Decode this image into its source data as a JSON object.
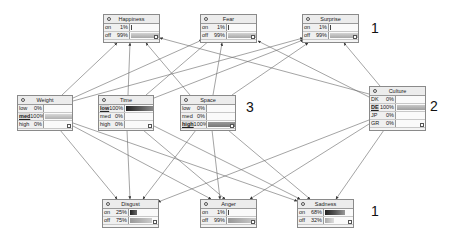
{
  "nodes": {
    "happiness": {
      "title": "Happiness",
      "states": [
        {
          "name": "on",
          "value": "1%",
          "pct": 1
        },
        {
          "name": "off",
          "value": "99%",
          "pct": 99
        }
      ]
    },
    "fear": {
      "title": "Fear",
      "states": [
        {
          "name": "on",
          "value": "1%",
          "pct": 1
        },
        {
          "name": "off",
          "value": "99%",
          "pct": 99
        }
      ]
    },
    "surprise": {
      "title": "Surprise",
      "states": [
        {
          "name": "on",
          "value": "1%",
          "pct": 1
        },
        {
          "name": "off",
          "value": "99%",
          "pct": 99
        }
      ]
    },
    "weight": {
      "title": "Weight",
      "states": [
        {
          "name": "low",
          "value": "0%",
          "pct": 0
        },
        {
          "name": "med",
          "value": "100%",
          "pct": 100,
          "selected": true
        },
        {
          "name": "high",
          "value": "0%",
          "pct": 0
        }
      ]
    },
    "time": {
      "title": "Time",
      "states": [
        {
          "name": "low",
          "value": "100%",
          "pct": 100,
          "selected": true
        },
        {
          "name": "med",
          "value": "0%",
          "pct": 0
        },
        {
          "name": "high",
          "value": "0%",
          "pct": 0
        }
      ]
    },
    "space": {
      "title": "Space",
      "states": [
        {
          "name": "low",
          "value": "0%",
          "pct": 0
        },
        {
          "name": "med",
          "value": "0%",
          "pct": 0
        },
        {
          "name": "high",
          "value": "100%",
          "pct": 100,
          "selected": true
        }
      ]
    },
    "culture": {
      "title": "Culture",
      "states": [
        {
          "name": "DK",
          "value": "0%",
          "pct": 0
        },
        {
          "name": "DE",
          "value": "100%",
          "pct": 100,
          "selected": true
        },
        {
          "name": "JP",
          "value": "0%",
          "pct": 0
        },
        {
          "name": "GR",
          "value": "0%",
          "pct": 0
        }
      ]
    },
    "disgust": {
      "title": "Disgust",
      "states": [
        {
          "name": "on",
          "value": "25%",
          "pct": 25
        },
        {
          "name": "off",
          "value": "75%",
          "pct": 75
        }
      ]
    },
    "angry": {
      "title": "Anger",
      "states": [
        {
          "name": "on",
          "value": "1%",
          "pct": 1
        },
        {
          "name": "off",
          "value": "99%",
          "pct": 99
        }
      ]
    },
    "sadness": {
      "title": "Sadness",
      "states": [
        {
          "name": "on",
          "value": "68%",
          "pct": 68
        },
        {
          "name": "off",
          "value": "32%",
          "pct": 32
        }
      ]
    }
  },
  "group_labels": {
    "top": "1",
    "culture": "2",
    "middle": "3",
    "bottom": "1"
  },
  "colors": {
    "edge": "#555555",
    "bar_dark": "#3a3a3a",
    "bar_light": "#b0b0b0"
  }
}
